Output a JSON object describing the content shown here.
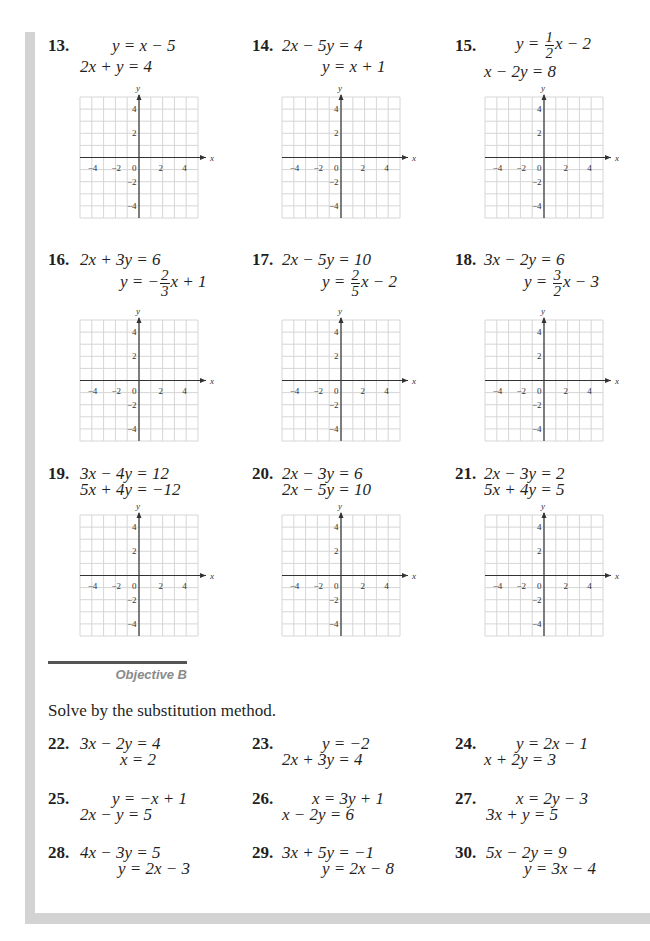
{
  "section": {
    "objective_label": "Objective B",
    "instructions": "Solve by the substitution method."
  },
  "graph_axes": {
    "x_label": "x",
    "y_label": "y",
    "x_ticks": [
      "−4",
      "−2",
      "0",
      "2",
      "4"
    ],
    "y_ticks": [
      "4",
      "2",
      "−2",
      "−4"
    ],
    "range": [
      -5,
      5
    ]
  },
  "graph_problems": [
    {
      "number": "13.",
      "line1": "y = x − 5",
      "line2": "2x + y = 4"
    },
    {
      "number": "14.",
      "line1": "2x − 5y = 4",
      "line2": "y = x + 1"
    },
    {
      "number": "15.",
      "line1_prefix": "y = ",
      "line1_frac_num": "1",
      "line1_frac_den": "2",
      "line1_suffix": "x − 2",
      "line2": "x − 2y = 8"
    },
    {
      "number": "16.",
      "line1": "2x + 3y = 6",
      "line2_prefix": "y = −",
      "line2_frac_num": "2",
      "line2_frac_den": "3",
      "line2_suffix": "x + 1"
    },
    {
      "number": "17.",
      "line1": "2x − 5y = 10",
      "line2_prefix": "y = ",
      "line2_frac_num": "2",
      "line2_frac_den": "5",
      "line2_suffix": "x − 2"
    },
    {
      "number": "18.",
      "line1": "3x − 2y = 6",
      "line2_prefix": "y = ",
      "line2_frac_num": "3",
      "line2_frac_den": "2",
      "line2_suffix": "x − 3"
    },
    {
      "number": "19.",
      "line1": "3x − 4y = 12",
      "line2": "5x + 4y = −12"
    },
    {
      "number": "20.",
      "line1": "2x − 3y = 6",
      "line2": "2x − 5y = 10"
    },
    {
      "number": "21.",
      "line1": "2x − 3y = 2",
      "line2": "5x + 4y = 5"
    }
  ],
  "substitution_problems": [
    {
      "number": "22.",
      "line1": "3x − 2y = 4",
      "line2": "x = 2"
    },
    {
      "number": "23.",
      "line1": "y = −2",
      "line2": "2x + 3y = 4"
    },
    {
      "number": "24.",
      "line1": "y = 2x − 1",
      "line2": "x + 2y = 3"
    },
    {
      "number": "25.",
      "line1": "y = −x + 1",
      "line2": "2x − y = 5"
    },
    {
      "number": "26.",
      "line1": "x = 3y + 1",
      "line2": "x − 2y = 6"
    },
    {
      "number": "27.",
      "line1": "x = 2y − 3",
      "line2": "3x + y = 5"
    },
    {
      "number": "28.",
      "line1": "4x − 3y = 5",
      "line2": "y = 2x − 3"
    },
    {
      "number": "29.",
      "line1": "3x + 5y = −1",
      "line2": "y = 2x − 8"
    },
    {
      "number": "30.",
      "line1": "5x − 2y = 9",
      "line2": "y = 3x − 4"
    }
  ],
  "colors": {
    "grid_line": "#d6d6d6",
    "axis": "#333333",
    "side_bar": "#d3d3d3",
    "objective_label": "#8a8a8a"
  }
}
